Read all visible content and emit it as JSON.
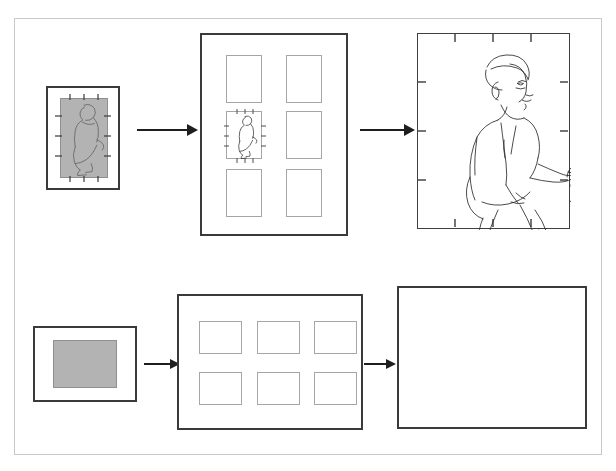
{
  "diagram": {
    "type": "flow",
    "background_color": "#ffffff",
    "outer_frame_color": "#c9c9c9",
    "frame_stroke_color": "#3a3a3a",
    "cell_stroke_color": "#a6a6a6",
    "gray_fill_color": "#b3b3b3",
    "line_art_color": "#2b2b2b",
    "rows": [
      {
        "id": "row-top",
        "orientation": "portrait",
        "stages": [
          {
            "id": "top-input",
            "role": "source-image",
            "label": "",
            "content": "low-resolution gray portrait photo of a crouching figure, mounted inside a white border with registration ticks",
            "has_ticks": true,
            "tick_count_per_edge": 3,
            "gray_fill": true
          },
          {
            "id": "top-grid",
            "role": "tile-sheet",
            "label": "",
            "content": "sheet of 6 empty portrait tiles arranged 2 columns by 3 rows; the middle-left tile holds the small figure",
            "columns": 2,
            "rows": 3,
            "filled_cell_index": 2,
            "has_ticks": false
          },
          {
            "id": "top-output",
            "role": "result-image",
            "label": "",
            "content": "enlarged clean line-art rendering of the crouching figure with registration ticks",
            "has_ticks": true,
            "tick_count_per_edge": 3,
            "gray_fill": false
          }
        ],
        "arrows": [
          {
            "id": "top-arrow-1",
            "from": "top-input",
            "to": "top-grid",
            "direction": "right"
          },
          {
            "id": "top-arrow-2",
            "from": "top-grid",
            "to": "top-output",
            "direction": "right"
          }
        ]
      },
      {
        "id": "row-bottom",
        "orientation": "landscape",
        "stages": [
          {
            "id": "bottom-input",
            "role": "source-image",
            "label": "",
            "content": "low-resolution gray landscape image block mounted inside a white border",
            "has_ticks": false,
            "gray_fill": true
          },
          {
            "id": "bottom-grid",
            "role": "tile-sheet",
            "label": "",
            "content": "sheet of 6 empty landscape tiles arranged 3 columns by 2 rows",
            "columns": 3,
            "rows": 2,
            "filled_cell_index": null,
            "has_ticks": false
          },
          {
            "id": "bottom-output",
            "role": "result-image",
            "label": "",
            "content": "empty enlarged landscape output panel",
            "has_ticks": false,
            "gray_fill": false
          }
        ],
        "arrows": [
          {
            "id": "bottom-arrow-1",
            "from": "bottom-input",
            "to": "bottom-grid",
            "direction": "right"
          },
          {
            "id": "bottom-arrow-2",
            "from": "bottom-grid",
            "to": "bottom-output",
            "direction": "right"
          }
        ]
      }
    ]
  }
}
